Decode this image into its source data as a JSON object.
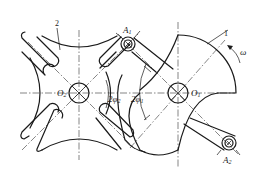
{
  "diagram": {
    "type": "geneva-mechanism",
    "parts": [
      {
        "id": "part-1",
        "label": "1",
        "description": "driving crank / locking disc"
      },
      {
        "id": "part-2",
        "label": "2",
        "description": "4-slot Geneva wheel"
      }
    ],
    "labels": {
      "part1": "1",
      "part2": "2",
      "omega": "ω",
      "O1_base": "O",
      "O1_sub": "1",
      "O2_base": "O",
      "O2_sub": "2",
      "A1_base": "A",
      "A1_sub": "1",
      "A2_base": "A",
      "A2_sub": "2",
      "phi1_coef": "2φ",
      "phi1_sub": "1",
      "phi2_coef": "2φ",
      "phi2_sub": "2"
    },
    "colors": {
      "stroke": "#1a1a1a",
      "background": "#ffffff"
    }
  }
}
